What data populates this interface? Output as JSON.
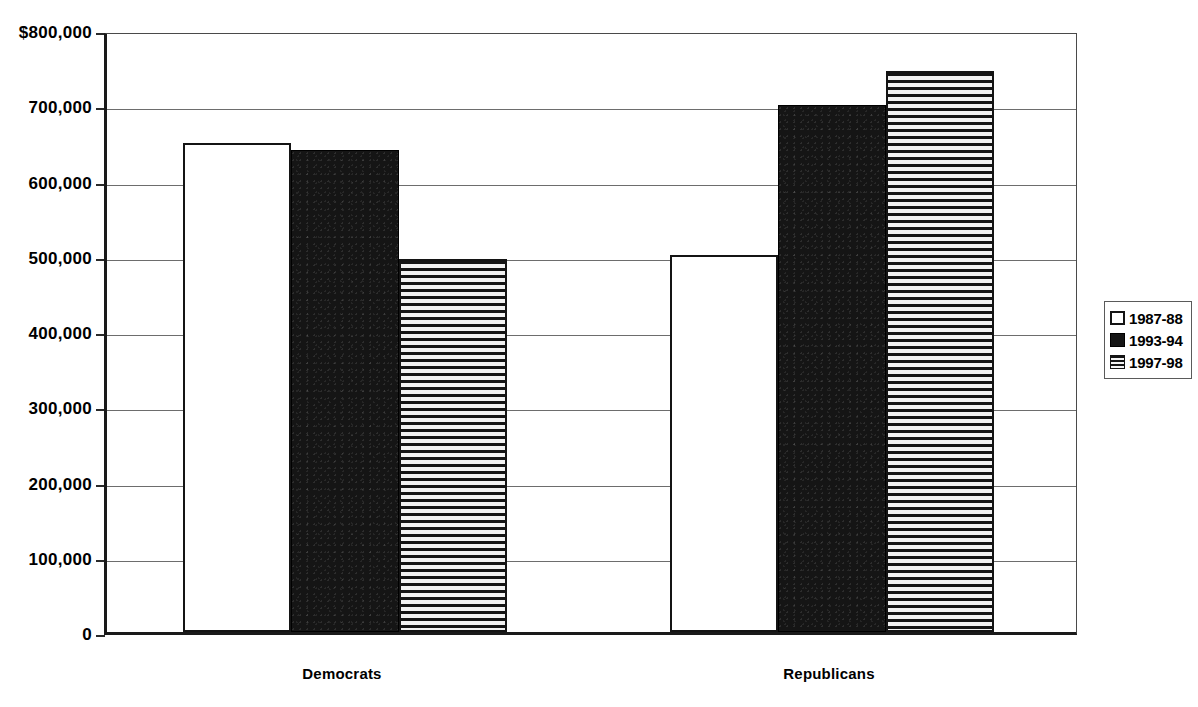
{
  "chart_data": {
    "type": "bar",
    "title": "",
    "subtitle": "",
    "xlabel": "",
    "ylabel": "",
    "categories": [
      "Democrats",
      "Republicans"
    ],
    "series": [
      {
        "name": "1987-88",
        "values": [
          650000,
          501000
        ],
        "fill": "open"
      },
      {
        "name": "1993-94",
        "values": [
          641000,
          700000
        ],
        "fill": "solid"
      },
      {
        "name": "1997-98",
        "values": [
          496000,
          745000
        ],
        "fill": "hstripe"
      }
    ],
    "ylim": [
      0,
      800000
    ],
    "ytick_values": [
      0,
      100000,
      200000,
      300000,
      400000,
      500000,
      600000,
      700000,
      800000
    ],
    "ytick_labels": [
      "0",
      "100,000",
      "200,000",
      "300,000",
      "400,000",
      "500,000",
      "600,000",
      "700,000",
      "$800,000"
    ],
    "grid": true,
    "grid_axis": "y",
    "legend_position": "right",
    "colors": {
      "ink": "#151515",
      "gridline": "#6d6d6d",
      "axis": "#1a1a1a",
      "background": "#ffffff"
    }
  },
  "legend": {
    "entries": [
      {
        "label": "1987-88",
        "fill": "open"
      },
      {
        "label": "1993-94",
        "fill": "solid"
      },
      {
        "label": "1997-98",
        "fill": "hstripe"
      }
    ]
  }
}
